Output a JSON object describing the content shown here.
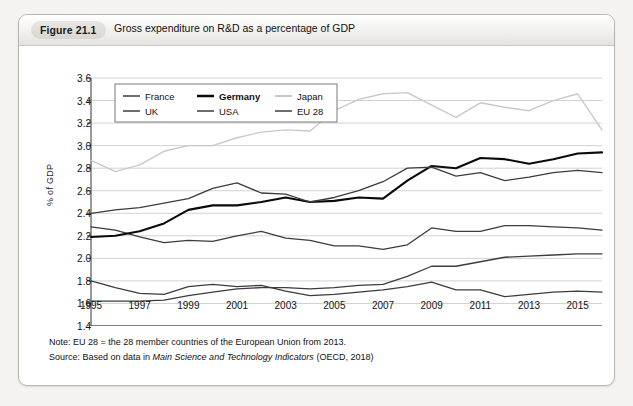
{
  "figure": {
    "tag": "Figure 21.1",
    "title": "Gross expenditure on R&D as a percentage of GDP"
  },
  "notes": {
    "note_prefix": "Note: EU 28",
    "note_equals": "=",
    "note_body": "the 28 member countries of the European Union from 2013.",
    "source_prefix": "Source: Based on data in",
    "source_italic": "Main Science and Technology Indicators",
    "source_suffix": "(OECD, 2018)"
  },
  "chart_data": {
    "type": "line",
    "title": "Gross expenditure on R&D as a percentage of GDP",
    "xlabel": "",
    "ylabel": "% of GDP",
    "xlim": [
      1995,
      2016
    ],
    "ylim": [
      1.4,
      3.6
    ],
    "ytick_step": 0.2,
    "grid": true,
    "legend_position": "top-left",
    "x": [
      1995,
      1996,
      1997,
      1998,
      1999,
      2000,
      2001,
      2002,
      2003,
      2004,
      2005,
      2006,
      2007,
      2008,
      2009,
      2010,
      2011,
      2012,
      2013,
      2014,
      2015,
      2016
    ],
    "xtick_labels": [
      "1995",
      "1997",
      "1999",
      "2001",
      "2003",
      "2005",
      "2007",
      "2009",
      "2011",
      "2013",
      "2015"
    ],
    "ytick_labels": [
      "1.4",
      "1.6",
      "1.8",
      "2.0",
      "2.2",
      "2.4",
      "2.6",
      "2.8",
      "3.0",
      "3.2",
      "3.4",
      "3.6"
    ],
    "series": [
      {
        "name": "France",
        "color": "#3c3c3c",
        "width": 1.3,
        "values": [
          2.28,
          2.25,
          2.19,
          2.14,
          2.16,
          2.15,
          2.2,
          2.24,
          2.18,
          2.16,
          2.11,
          2.11,
          2.08,
          2.12,
          2.27,
          2.24,
          2.24,
          2.29,
          2.29,
          2.28,
          2.27,
          2.25
        ]
      },
      {
        "name": "Germany",
        "color": "#0a0a0a",
        "width": 2.1,
        "values": [
          2.19,
          2.2,
          2.24,
          2.31,
          2.43,
          2.47,
          2.47,
          2.5,
          2.54,
          2.5,
          2.51,
          2.54,
          2.53,
          2.69,
          2.82,
          2.8,
          2.89,
          2.88,
          2.84,
          2.88,
          2.93,
          2.94
        ]
      },
      {
        "name": "Japan",
        "color": "#c9c9c9",
        "width": 1.4,
        "values": [
          2.87,
          2.77,
          2.83,
          2.95,
          3.0,
          3.0,
          3.07,
          3.12,
          3.14,
          3.13,
          3.31,
          3.41,
          3.46,
          3.47,
          3.36,
          3.25,
          3.38,
          3.34,
          3.31,
          3.4,
          3.46,
          3.14
        ]
      },
      {
        "name": "UK",
        "color": "#3c3c3c",
        "width": 1.3,
        "values": [
          1.8,
          1.74,
          1.69,
          1.68,
          1.75,
          1.77,
          1.75,
          1.76,
          1.71,
          1.67,
          1.68,
          1.7,
          1.72,
          1.75,
          1.79,
          1.72,
          1.72,
          1.66,
          1.68,
          1.7,
          1.71,
          1.7
        ]
      },
      {
        "name": "USA",
        "color": "#3c3c3c",
        "width": 1.3,
        "values": [
          2.4,
          2.43,
          2.45,
          2.49,
          2.53,
          2.62,
          2.67,
          2.58,
          2.57,
          2.5,
          2.54,
          2.6,
          2.68,
          2.8,
          2.81,
          2.73,
          2.76,
          2.69,
          2.72,
          2.76,
          2.78,
          2.76
        ]
      },
      {
        "name": "EU 28",
        "color": "#3c3c3c",
        "width": 1.3,
        "values": [
          1.62,
          1.62,
          1.62,
          1.63,
          1.67,
          1.7,
          1.73,
          1.74,
          1.74,
          1.73,
          1.74,
          1.76,
          1.77,
          1.84,
          1.93,
          1.93,
          1.97,
          2.01,
          2.02,
          2.03,
          2.04,
          2.04
        ]
      }
    ],
    "legend": [
      {
        "label": "France",
        "color": "#3c3c3c",
        "width": 1.6
      },
      {
        "label": "Germany",
        "color": "#0a0a0a",
        "width": 2.4
      },
      {
        "label": "Japan",
        "color": "#c9c9c9",
        "width": 1.8
      },
      {
        "label": "UK",
        "color": "#3c3c3c",
        "width": 1.6
      },
      {
        "label": "USA",
        "color": "#3c3c3c",
        "width": 1.6
      },
      {
        "label": "EU 28",
        "color": "#3c3c3c",
        "width": 1.6
      }
    ]
  }
}
